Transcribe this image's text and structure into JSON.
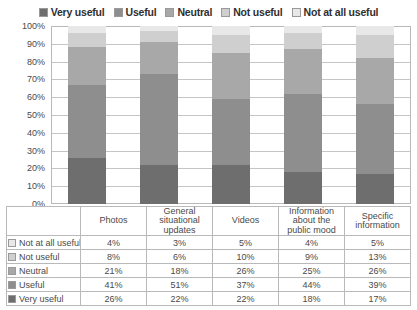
{
  "chart_data": {
    "type": "bar",
    "subtype": "stacked-percent-column",
    "title": "",
    "xlabel": "",
    "ylabel": "",
    "ylim": [
      0,
      100
    ],
    "ytick_labels": [
      "100%",
      "90%",
      "80%",
      "70%",
      "60%",
      "50%",
      "40%",
      "30%",
      "20%",
      "10%",
      "0%"
    ],
    "ytick_values": [
      100,
      90,
      80,
      70,
      60,
      50,
      40,
      30,
      20,
      10,
      0
    ],
    "grid": true,
    "legend_position": "top",
    "categories": [
      "Photos",
      "General situational updates",
      "Videos",
      "Information about the public mood",
      "Specific information"
    ],
    "stack_order_bottom_to_top": [
      "Very useful",
      "Useful",
      "Neutral",
      "Not useful",
      "Not at all useful"
    ],
    "series": [
      {
        "name": "Very useful",
        "color": "#6e6e6e",
        "values": [
          26,
          22,
          22,
          18,
          17
        ]
      },
      {
        "name": "Useful",
        "color": "#8e8e8e",
        "values": [
          41,
          51,
          37,
          44,
          39
        ]
      },
      {
        "name": "Neutral",
        "color": "#a8a8a8",
        "values": [
          21,
          18,
          26,
          25,
          26
        ]
      },
      {
        "name": "Not useful",
        "color": "#cfcfcf",
        "values": [
          8,
          6,
          10,
          9,
          13
        ]
      },
      {
        "name": "Not at all useful",
        "color": "#e8e8e8",
        "values": [
          4,
          3,
          5,
          4,
          5
        ]
      }
    ]
  },
  "legend": {
    "items": [
      {
        "label": "Very useful",
        "color": "#6e6e6e"
      },
      {
        "label": "Useful",
        "color": "#8e8e8e"
      },
      {
        "label": "Neutral",
        "color": "#a8a8a8"
      },
      {
        "label": "Not useful",
        "color": "#cfcfcf"
      },
      {
        "label": "Not at all useful",
        "color": "#e8e8e8"
      }
    ]
  },
  "table": {
    "column_headers": [
      "Photos",
      "General situational updates",
      "Videos",
      "Information about the public mood",
      "Specific information"
    ],
    "rows": [
      {
        "label": "Not at all useful",
        "color": "#e8e8e8",
        "values": [
          "4%",
          "3%",
          "5%",
          "4%",
          "5%"
        ]
      },
      {
        "label": "Not useful",
        "color": "#cfcfcf",
        "values": [
          "8%",
          "6%",
          "10%",
          "9%",
          "13%"
        ]
      },
      {
        "label": "Neutral",
        "color": "#a8a8a8",
        "values": [
          "21%",
          "18%",
          "26%",
          "25%",
          "26%"
        ]
      },
      {
        "label": "Useful",
        "color": "#8e8e8e",
        "values": [
          "41%",
          "51%",
          "37%",
          "44%",
          "39%"
        ]
      },
      {
        "label": "Very useful",
        "color": "#6e6e6e",
        "values": [
          "26%",
          "22%",
          "22%",
          "18%",
          "17%"
        ]
      }
    ]
  }
}
